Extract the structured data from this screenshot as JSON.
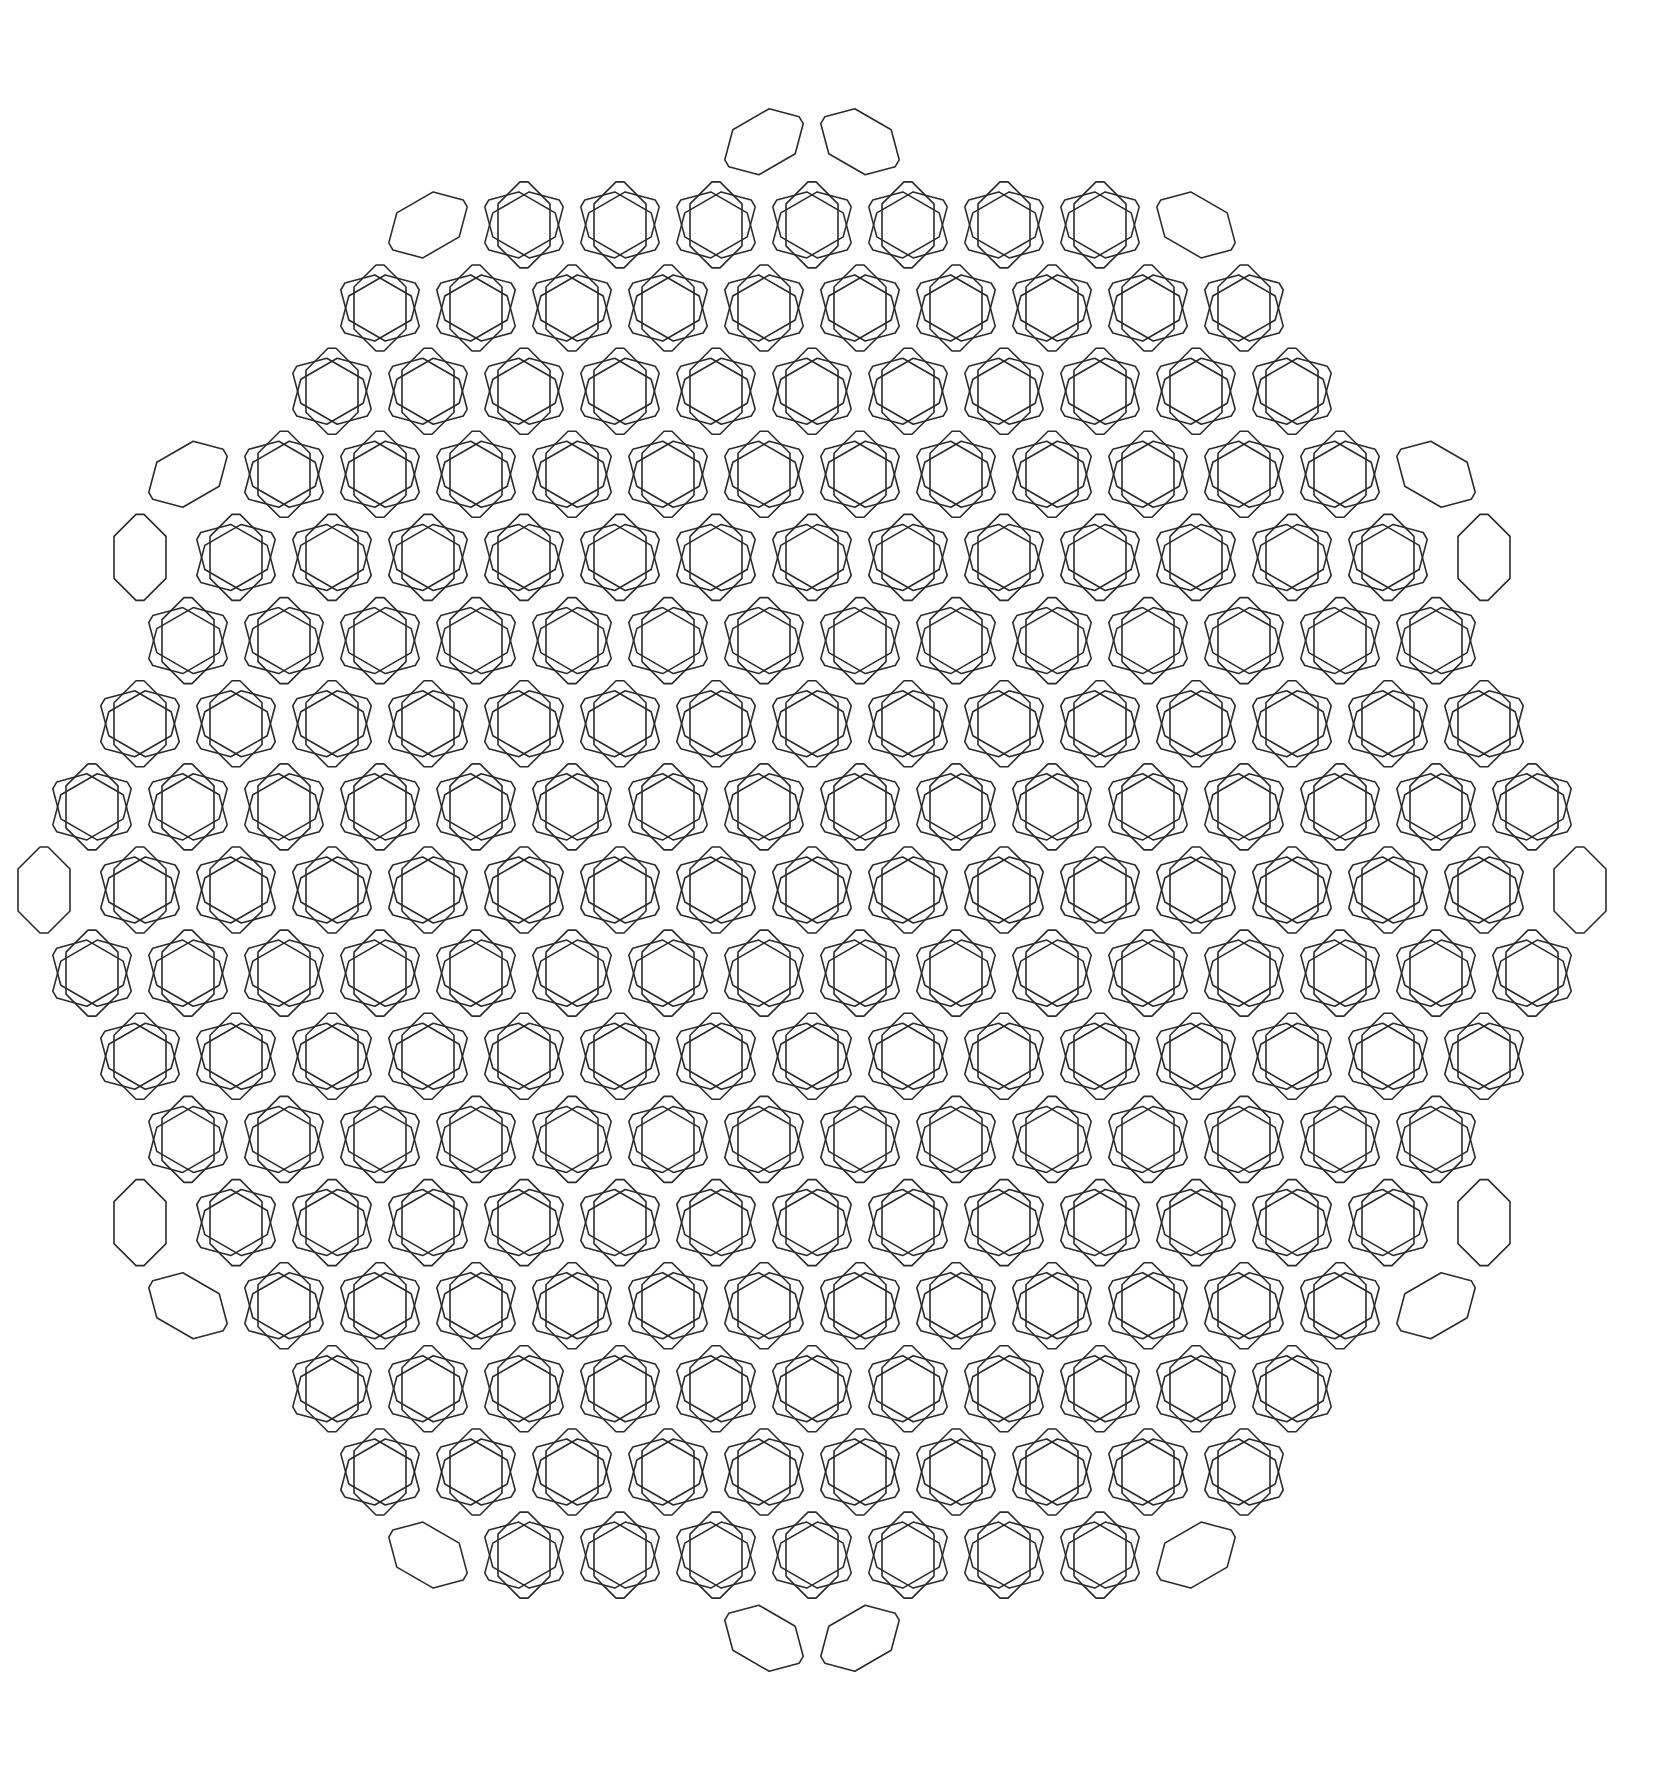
{
  "figure": {
    "background": "#ffffff",
    "stroke": "#2b2b2b",
    "center": [
      812,
      890
    ],
    "lattice_spacing": 96,
    "outer_radius": 790,
    "octagon": {
      "length": 86,
      "width": 52,
      "bevel": 22
    },
    "orientations_deg": [
      90,
      30,
      150
    ]
  }
}
